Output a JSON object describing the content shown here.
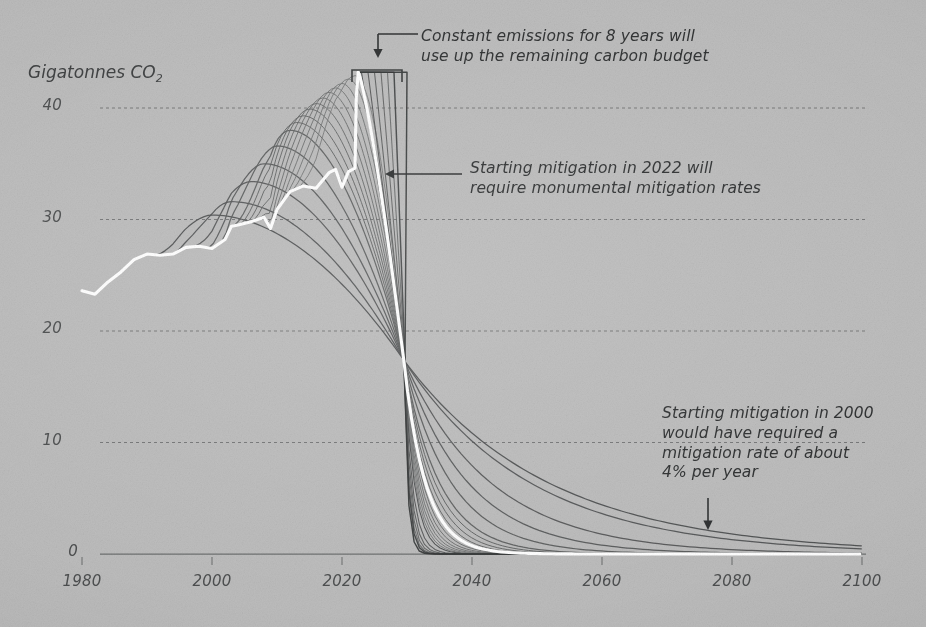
{
  "chart_data": {
    "type": "line",
    "title": "",
    "xlabel": "",
    "ylabel": "Gigatonnes CO2",
    "ylabel_display": "Gigatonnes CO",
    "ylabel_sub": "2",
    "xlim": [
      1980,
      2100
    ],
    "ylim": [
      0,
      44
    ],
    "xticks": [
      1980,
      2000,
      2020,
      2040,
      2060,
      2080,
      2100
    ],
    "xtick_labels": [
      "1980",
      "2000",
      "2020",
      "2040",
      "2060",
      "2080",
      "2100"
    ],
    "yticks": [
      0,
      10,
      20,
      30,
      40
    ],
    "ytick_labels": [
      "0",
      "10",
      "20",
      "30",
      "40"
    ],
    "grid": "horizontal-dashed",
    "legend": "none",
    "convergence": {
      "year": 2029.5,
      "value": 17.4
    },
    "series": [
      {
        "name": "Historical emissions",
        "color": "#ffffff",
        "role": "history",
        "x": [
          1980,
          1982,
          1984,
          1986,
          1988,
          1990,
          1992,
          1994,
          1996,
          1998,
          2000,
          2002,
          2003,
          2004,
          2006,
          2008,
          2009,
          2010,
          2012,
          2014,
          2016,
          2018,
          2019,
          2020,
          2021,
          2022
        ],
        "values": [
          23.6,
          23.3,
          24.4,
          25.3,
          26.4,
          26.9,
          26.8,
          26.9,
          27.5,
          27.6,
          27.4,
          28.2,
          29.4,
          29.5,
          29.8,
          30.2,
          29.2,
          30.9,
          32.5,
          33.0,
          32.8,
          34.2,
          34.5,
          32.9,
          34.3,
          34.6
        ]
      },
      {
        "name": "Historical + 2022 mitigation pathway",
        "color": "#ffffff",
        "role": "chosen-pathway",
        "start_year": 2022,
        "peak_value": 43.2,
        "peak_year": 2022.5,
        "note": "Starting mitigation in 2022 requires a near-vertical decline through the convergence point"
      },
      {
        "name": "Mitigation starting 2000",
        "color": "#4a4c4d",
        "start_year": 2000,
        "peak_value": 30.4,
        "rate_pct_per_year": 4
      },
      {
        "name": "Mitigation starting 2003",
        "color": "#4e5051",
        "start_year": 2003,
        "peak_value": 31.6
      },
      {
        "name": "Mitigation starting 2006",
        "color": "#515354",
        "start_year": 2006,
        "peak_value": 33.4
      },
      {
        "name": "Mitigation starting 2008",
        "color": "#545657",
        "start_year": 2008,
        "peak_value": 35.0
      },
      {
        "name": "Mitigation starting 2010",
        "color": "#575959",
        "start_year": 2010,
        "peak_value": 36.6
      },
      {
        "name": "Mitigation starting 2012",
        "color": "#5a5c5c",
        "start_year": 2012,
        "peak_value": 38.0
      },
      {
        "name": "Mitigation starting 2013",
        "color": "#5d5f5f",
        "start_year": 2013,
        "peak_value": 38.7
      },
      {
        "name": "Mitigation starting 2014",
        "color": "#606262",
        "start_year": 2014,
        "peak_value": 39.3
      },
      {
        "name": "Mitigation starting 2015",
        "color": "#636565",
        "start_year": 2015,
        "peak_value": 39.9
      },
      {
        "name": "Mitigation starting 2016",
        "color": "#666868",
        "start_year": 2016,
        "peak_value": 40.4
      },
      {
        "name": "Mitigation starting 2017",
        "color": "#696b6b",
        "start_year": 2017,
        "peak_value": 40.9
      },
      {
        "name": "Mitigation starting 2018",
        "color": "#6c6e6e",
        "start_year": 2018,
        "peak_value": 41.4
      },
      {
        "name": "Mitigation starting 2019",
        "color": "#6f7171",
        "start_year": 2019,
        "peak_value": 41.8
      },
      {
        "name": "Mitigation starting 2020",
        "color": "#727474",
        "start_year": 2020,
        "peak_value": 42.2
      },
      {
        "name": "Mitigation starting 2021",
        "color": "#757777",
        "start_year": 2021,
        "peak_value": 42.6
      },
      {
        "name": "Mitigation starting 2022",
        "color": "#787a7a",
        "start_year": 2022,
        "peak_value": 42.9
      },
      {
        "name": "Constant emissions to 2023",
        "color": "#4a4c4d",
        "start_year": 2023,
        "constant_value": 43.2
      },
      {
        "name": "Constant emissions to 2024",
        "color": "#515354",
        "start_year": 2024,
        "constant_value": 43.2
      },
      {
        "name": "Constant emissions to 2025",
        "color": "#585a5a",
        "start_year": 2025,
        "constant_value": 43.2
      },
      {
        "name": "Constant emissions to 2026",
        "color": "#5f6161",
        "start_year": 2026,
        "constant_value": 43.2
      },
      {
        "name": "Constant emissions to 2027",
        "color": "#666868",
        "start_year": 2027,
        "constant_value": 43.2
      },
      {
        "name": "Constant emissions to 2028",
        "color": "#3e4041",
        "start_year": 2028,
        "constant_value": 43.2
      },
      {
        "name": "Constant emissions to 2030 (budget exhausted)",
        "color": "#343636",
        "start_year": 2030,
        "constant_value": 43.2
      }
    ]
  },
  "annotations": [
    {
      "id": "constant-emissions",
      "text": "Constant emissions for 8 years will\nuse up the remaining carbon budget",
      "marker": "bracket-with-down-arrow"
    },
    {
      "id": "mitigation-2022",
      "text": "Starting mitigation in 2022 will\nrequire monumental mitigation rates",
      "marker": "left-arrow"
    },
    {
      "id": "mitigation-2000",
      "text": "Starting mitigation in 2000\nwould have required a\nmitigation rate of about\n4% per year",
      "marker": "down-arrow"
    }
  ],
  "colors": {
    "background": "#bcbcbc",
    "gridline": "#6a6c6d",
    "axis_text": "#4d4f50",
    "annotation_text": "#2f3132",
    "history_line": "#ffffff",
    "scenario_line_dark": "#3e4041",
    "scenario_line_light": "#7a7c7c"
  }
}
